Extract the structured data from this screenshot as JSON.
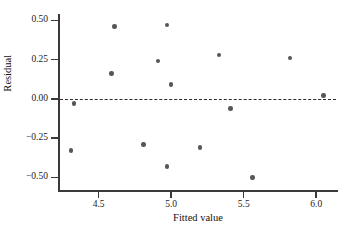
{
  "chart_data": {
    "type": "scatter",
    "title": "",
    "xlabel": "Fitted value",
    "ylabel": "Residual",
    "xlim": [
      4.22,
      6.15
    ],
    "ylim": [
      -0.58,
      0.54
    ],
    "xticks": [
      4.5,
      5.0,
      5.5,
      6.0
    ],
    "xtick_labels": [
      "4.5",
      "5.0",
      "5.5",
      "6.0"
    ],
    "yticks": [
      0.5,
      0.25,
      0.0,
      -0.25,
      -0.5
    ],
    "ytick_labels": [
      "0.50",
      "0.25",
      "0.00",
      "-0.25",
      "-0.50"
    ],
    "grid": false,
    "legend": null,
    "reference_line": {
      "type": "horizontal",
      "y": 0.0,
      "style": "dashed",
      "color": "#2b2b2b"
    },
    "marker_color": "#55555a",
    "points": [
      {
        "x": 4.33,
        "y": -0.03
      },
      {
        "x": 4.31,
        "y": -0.33
      },
      {
        "x": 4.61,
        "y": 0.46
      },
      {
        "x": 4.59,
        "y": 0.16
      },
      {
        "x": 4.81,
        "y": -0.29
      },
      {
        "x": 4.91,
        "y": 0.24
      },
      {
        "x": 4.97,
        "y": 0.47
      },
      {
        "x": 4.97,
        "y": -0.43
      },
      {
        "x": 5.0,
        "y": 0.09
      },
      {
        "x": 5.2,
        "y": -0.31
      },
      {
        "x": 5.33,
        "y": 0.28
      },
      {
        "x": 5.41,
        "y": -0.06
      },
      {
        "x": 5.56,
        "y": -0.5
      },
      {
        "x": 5.82,
        "y": 0.26
      },
      {
        "x": 6.05,
        "y": 0.02
      }
    ]
  }
}
